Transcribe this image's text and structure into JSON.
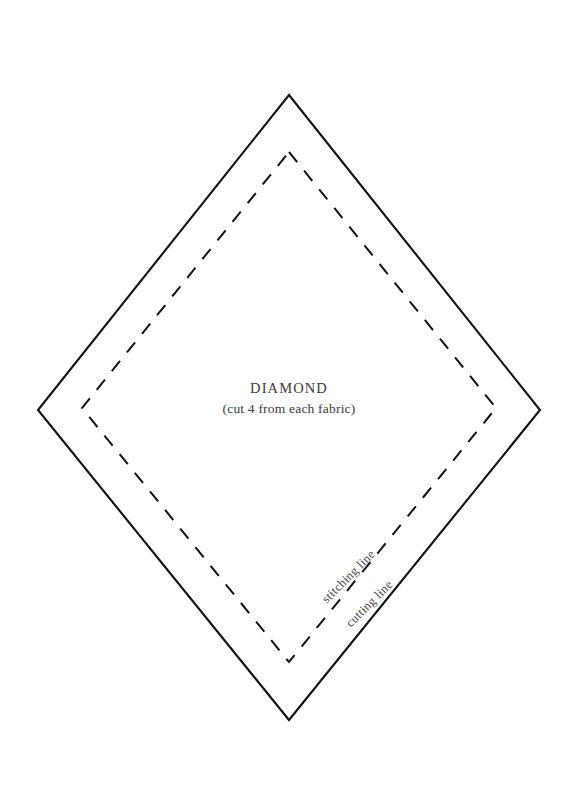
{
  "page": {
    "background_color": "#ffffff",
    "width": 578,
    "height": 801
  },
  "template": {
    "title": "DIAMOND",
    "subtitle": "(cut 4 from each fabric)",
    "shape_name": "diamond-template",
    "ink_color": "#111111",
    "text_color": "#3b3b40"
  },
  "annotations": {
    "stitching_line": "stitching line",
    "cutting_line": "cutting line"
  },
  "geometry": {
    "cutting_outline": {
      "name": "cutting-line-outline",
      "style": "solid",
      "stroke_width": 2.1,
      "points": "289,95 540,410 289,720 38,410"
    },
    "stitching_outline": {
      "name": "stitching-line-outline",
      "style": "dashed",
      "stroke_width": 2.0,
      "dash_array": "13 11",
      "points": "289,152 496,408 289,662 82,408"
    }
  }
}
